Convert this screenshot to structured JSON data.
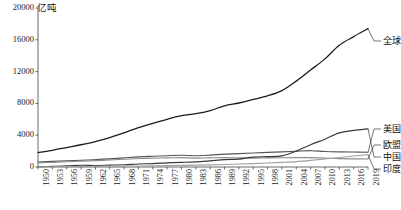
{
  "chart_data": {
    "type": "line",
    "title": "",
    "subtitle": "",
    "unit_label": "亿吨",
    "xlabel": "",
    "ylabel": "",
    "xlim": [
      1950,
      2019
    ],
    "ylim": [
      0,
      20000
    ],
    "ytick_labels": [
      "20000",
      "16000",
      "12000",
      "8000",
      "4000",
      "0"
    ],
    "yticks": [
      20000,
      16000,
      12000,
      8000,
      4000,
      0
    ],
    "xtick_labels": [
      "1950",
      "1953",
      "1956",
      "1959",
      "1962",
      "1965",
      "1968",
      "1971",
      "1974",
      "1977",
      "1980",
      "1983",
      "1986",
      "1989",
      "1992",
      "1995",
      "1998",
      "2001",
      "2004",
      "2007",
      "2010",
      "2013",
      "2016",
      "2019"
    ],
    "xticks": [
      1950,
      1953,
      1956,
      1959,
      1962,
      1965,
      1968,
      1971,
      1974,
      1977,
      1980,
      1983,
      1986,
      1989,
      1992,
      1995,
      1998,
      2001,
      2004,
      2007,
      2010,
      2013,
      2016,
      2019
    ],
    "grid": false,
    "legend_position": "right-inline-leader-labels",
    "x": [
      1950,
      1953,
      1956,
      1959,
      1962,
      1965,
      1968,
      1971,
      1974,
      1977,
      1980,
      1983,
      1986,
      1989,
      1992,
      1995,
      1998,
      2001,
      2004,
      2007,
      2010,
      2013,
      2016,
      2019
    ],
    "series": [
      {
        "name": "全球",
        "color": "#1c1c1c",
        "width": 1.3,
        "label_text": "全球",
        "values": [
          1800,
          2100,
          2450,
          2800,
          3200,
          3700,
          4300,
          4950,
          5500,
          6000,
          6450,
          6700,
          7100,
          7700,
          8050,
          8500,
          8950,
          9600,
          10800,
          12200,
          13600,
          15300,
          16400,
          17400
        ]
      },
      {
        "name": "美国",
        "color": "#555555",
        "width": 1.15,
        "label_text": "美国",
        "values": [
          620,
          700,
          790,
          850,
          930,
          1030,
          1150,
          1270,
          1350,
          1420,
          1480,
          1420,
          1500,
          1620,
          1680,
          1760,
          1840,
          1900,
          1980,
          2050,
          1950,
          1900,
          1880,
          1850
        ]
      },
      {
        "name": "欧盟",
        "color": "#8d8d8d",
        "width": 1.15,
        "label_text": "欧盟",
        "values": [
          520,
          590,
          660,
          720,
          800,
          880,
          970,
          1070,
          1120,
          1140,
          1180,
          1110,
          1150,
          1180,
          1140,
          1120,
          1140,
          1160,
          1180,
          1180,
          1120,
          1060,
          1030,
          1010
        ]
      },
      {
        "name": "中国",
        "color": "#3a3a3a",
        "width": 1.2,
        "label_text": "中国",
        "values": [
          40,
          80,
          130,
          220,
          190,
          240,
          280,
          380,
          430,
          520,
          580,
          650,
          780,
          920,
          1000,
          1250,
          1300,
          1400,
          2000,
          2800,
          3500,
          4300,
          4600,
          4800
        ]
      },
      {
        "name": "印度",
        "color": "#a0a0a0",
        "width": 1.1,
        "label_text": "印度",
        "values": [
          30,
          40,
          50,
          60,
          80,
          95,
          110,
          130,
          150,
          170,
          200,
          230,
          270,
          320,
          370,
          430,
          500,
          580,
          680,
          830,
          1000,
          1200,
          1380,
          1550
        ]
      }
    ],
    "leader_labels": [
      {
        "text": "全球",
        "anchor_y_value": 17400,
        "label_top_px": 36
      },
      {
        "text": "美国",
        "anchor_y_value": 1850,
        "label_top_px": 124
      },
      {
        "text": "欧盟",
        "anchor_y_value": 1010,
        "label_top_px": 140
      },
      {
        "text": "中国",
        "anchor_y_value": 4800,
        "label_top_px": 152
      },
      {
        "text": "印度",
        "anchor_y_value": 1550,
        "label_top_px": 164
      }
    ]
  }
}
